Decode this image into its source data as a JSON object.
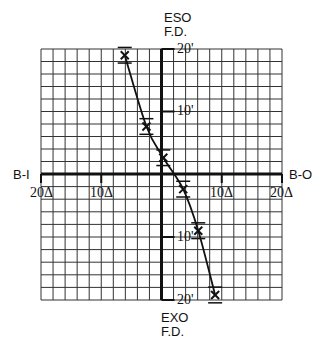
{
  "chart_data": {
    "type": "line",
    "title": "",
    "xlabel_left": "B-I",
    "xlabel_right": "B-O",
    "ylabel_top": [
      "ESO",
      "F.D."
    ],
    "ylabel_bottom": [
      "EXO",
      "F.D."
    ],
    "x_ticks": [
      "20Δ",
      "10Δ",
      "10Δ",
      "20Δ"
    ],
    "x_tick_values": [
      -20,
      -10,
      10,
      20
    ],
    "y_ticks": [
      "20'",
      "10'",
      "10'",
      "20'"
    ],
    "y_tick_values": [
      20,
      10,
      -10,
      -20
    ],
    "xlim": [
      -20,
      20
    ],
    "ylim": [
      -20,
      20
    ],
    "grid": true,
    "grid_step": 2,
    "series": [
      {
        "name": "measurements",
        "marker": "x",
        "points": [
          {
            "x": -6.1,
            "y": 19.0,
            "err": 2.0
          },
          {
            "x": -2.5,
            "y": 7.6,
            "err": 2.0
          },
          {
            "x": 0.3,
            "y": 2.6,
            "err": 2.0
          },
          {
            "x": 3.6,
            "y": -2.4,
            "err": 2.0
          },
          {
            "x": 6.1,
            "y": -9.0,
            "err": 2.0
          },
          {
            "x": 8.9,
            "y": -19.2,
            "err": 2.0
          }
        ]
      }
    ]
  },
  "labels": {
    "eso": "ESO",
    "eso_fd": "F.D.",
    "exo": "EXO",
    "exo_fd": "F.D.",
    "bi": "B-I",
    "bo": "B-O",
    "x_left_20": "20Δ",
    "x_left_10": "10Δ",
    "x_right_10": "10Δ",
    "x_right_20": "20Δ",
    "y_top_20": "20'",
    "y_top_10": "10'",
    "y_bot_10": "10'",
    "y_bot_20": "20'"
  },
  "colors": {
    "ink": "#111111",
    "grid": "#333333",
    "background": "#ffffff"
  }
}
